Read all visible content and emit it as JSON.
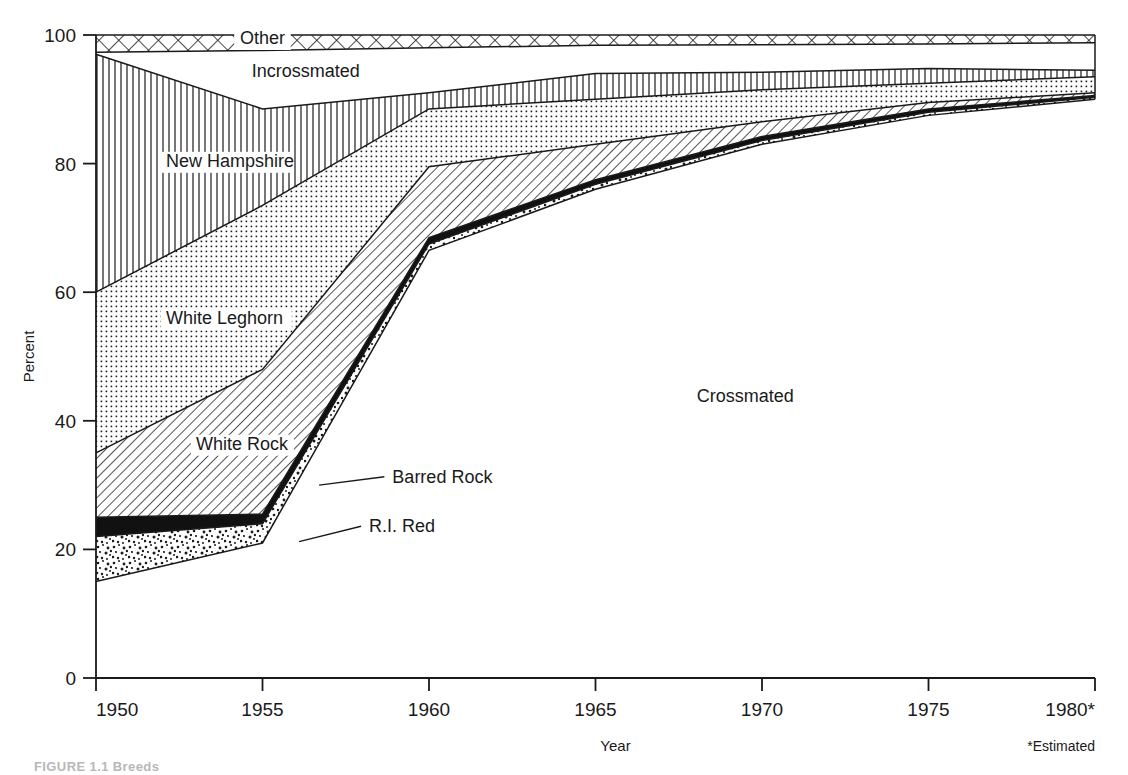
{
  "figure": {
    "caption": "FIGURE 1.1  Breeds",
    "estimated_note": "*Estimated"
  },
  "chart_data": {
    "type": "area",
    "title": "",
    "subtitle": "",
    "xlabel": "Year",
    "ylabel": "Percent",
    "xlim": [
      1950,
      1980
    ],
    "ylim": [
      0,
      100
    ],
    "grid": false,
    "legend": "inline-labels",
    "x": [
      1950,
      1955,
      1960,
      1965,
      1970,
      1975,
      1980
    ],
    "xticklabels": [
      "1950",
      "1955",
      "1960",
      "1965",
      "1970",
      "1975",
      "1980*"
    ],
    "yticks": [
      0,
      20,
      40,
      60,
      80,
      100
    ],
    "yticklabels": [
      "0",
      "20",
      "40",
      "60",
      "80",
      "100"
    ],
    "stacking": "cumulative-boundaries",
    "boundaries": [
      {
        "name": "ri-red-bottom",
        "label": "R.I. Red bottom",
        "values": [
          15,
          21,
          66.5,
          76,
          83,
          87.5,
          90
        ]
      },
      {
        "name": "ri-red-top",
        "label": "R.I. Red top / Barred Rock bottom",
        "values": [
          22,
          24,
          67.5,
          76.8,
          83.6,
          88,
          90.3
        ]
      },
      {
        "name": "barred-rock-top",
        "label": "Barred Rock top / White Rock bottom",
        "values": [
          25,
          25.5,
          68.5,
          77.5,
          84.2,
          88.5,
          90.6
        ]
      },
      {
        "name": "white-rock-top",
        "label": "White Rock top / White Leghorn bottom",
        "values": [
          35,
          48,
          79.5,
          83,
          86.5,
          89.5,
          91
        ]
      },
      {
        "name": "white-leghorn-top",
        "label": "White Leghorn top / New Hampshire bottom",
        "values": [
          60,
          73.5,
          88.5,
          90,
          91.5,
          92.5,
          93.5
        ]
      },
      {
        "name": "new-hampshire-top",
        "label": "New Hampshire top / Incrossmated bottom",
        "values": [
          97,
          88.5,
          91,
          94,
          94.2,
          94.8,
          94.5
        ]
      },
      {
        "name": "incrossmated-top",
        "label": "Incrossmated top / Other bottom",
        "values": [
          97.3,
          97.6,
          98,
          98.4,
          98.5,
          98.6,
          98.8
        ]
      },
      {
        "name": "other-top",
        "label": "Other top",
        "values": [
          100,
          100,
          100,
          100,
          100,
          100,
          100
        ]
      }
    ],
    "bands": [
      {
        "key": "crossmated",
        "label": "Crossmated",
        "fill": "white",
        "label_x": 1969.5,
        "label_y": 43
      },
      {
        "key": "ri-red",
        "label": "R.I. Red",
        "fill": "stipple",
        "label_x": 1958.2,
        "label_y": 23.8
      },
      {
        "key": "barred-rock",
        "label": "Barred Rock",
        "fill": "solid-black",
        "label_x": 1959.0,
        "label_y": 31.5
      },
      {
        "key": "white-rock",
        "label": "White Rock",
        "fill": "diagonal",
        "label_x": 1953.0,
        "label_y": 35.5
      },
      {
        "key": "white-leghorn",
        "label": "White Leghorn",
        "fill": "dotgrid",
        "label_x": 1952.1,
        "label_y": 55.0
      },
      {
        "key": "new-hampshire",
        "label": "New Hampshire",
        "fill": "vertical",
        "label_x": 1952.1,
        "label_y": 79.5
      },
      {
        "key": "incrossmated",
        "label": "Incrossmated",
        "fill": "white",
        "label_x": 1956.3,
        "label_y": 93.5
      },
      {
        "key": "other",
        "label": "Other",
        "fill": "crosshatch",
        "label_x": 1955.0,
        "label_y": 98.6
      }
    ],
    "annotations": [
      {
        "text": "Barred Rock",
        "leader_from_x": 1956.7,
        "leader_from_y": 30.0,
        "text_x": 1958.9,
        "text_y": 31.3
      },
      {
        "text": "R.I. Red",
        "leader_from_x": 1956.1,
        "leader_from_y": 21.2,
        "text_x": 1958.2,
        "text_y": 23.6
      }
    ]
  }
}
